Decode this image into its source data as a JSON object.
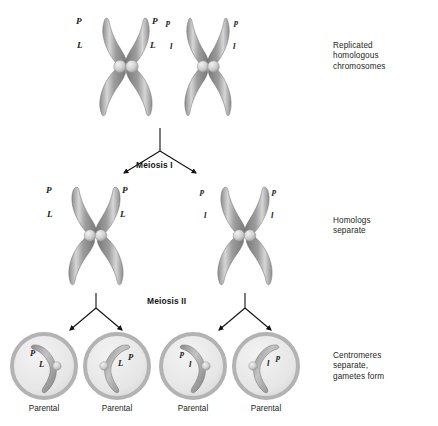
{
  "figure": {
    "stage_labels": {
      "meiosis_i": "Meiosis I",
      "meiosis_ii": "Meiosis II"
    },
    "annotations": [
      {
        "id": "replicated",
        "text": "Replicated\nhomologous\nchromosomes"
      },
      {
        "id": "homologs",
        "text": "Homologs\nseparate"
      },
      {
        "id": "centromeres",
        "text": "Centromeres\nseparate,\ngametes form"
      }
    ],
    "top_chromosomes": [
      {
        "id": "top-left",
        "alleles": [
          {
            "text": "P",
            "pos": "upper-left"
          },
          {
            "text": "P",
            "pos": "upper-right"
          },
          {
            "text": "L",
            "pos": "lower-left"
          },
          {
            "text": "L",
            "pos": "lower-right"
          }
        ]
      },
      {
        "id": "top-right",
        "alleles": [
          {
            "text": "p",
            "pos": "upper-left"
          },
          {
            "text": "p",
            "pos": "upper-right"
          },
          {
            "text": "l",
            "pos": "lower-left"
          },
          {
            "text": "l",
            "pos": "lower-right"
          }
        ]
      }
    ],
    "middle_chromosomes": [
      {
        "id": "mid-left",
        "alleles": [
          {
            "text": "P",
            "pos": "upper-left"
          },
          {
            "text": "P",
            "pos": "upper-right"
          },
          {
            "text": "L",
            "pos": "lower-left"
          },
          {
            "text": "L",
            "pos": "lower-right"
          }
        ]
      },
      {
        "id": "mid-right",
        "alleles": [
          {
            "text": "p",
            "pos": "upper-left"
          },
          {
            "text": "p",
            "pos": "upper-right"
          },
          {
            "text": "l",
            "pos": "lower-left"
          },
          {
            "text": "l",
            "pos": "lower-right"
          }
        ]
      }
    ],
    "gametes": [
      {
        "id": "gamete-1",
        "caption": "Parental",
        "alleles": [
          "P",
          "L"
        ],
        "mirrored": false
      },
      {
        "id": "gamete-2",
        "caption": "Parental",
        "alleles": [
          "L",
          "P"
        ],
        "mirrored": true
      },
      {
        "id": "gamete-3",
        "caption": "Parental",
        "alleles": [
          "p",
          "l"
        ],
        "mirrored": false
      },
      {
        "id": "gamete-4",
        "caption": "Parental",
        "alleles": [
          "l",
          "p"
        ],
        "mirrored": true
      }
    ],
    "colors": {
      "chromosome_dark": "#7d7d7d",
      "chromosome_mid": "#9a9a9a",
      "chromosome_light": "#c9c9c9",
      "centromere": "#cfcfcf",
      "cell_ring": "#b3b3b3",
      "cell_fill": "#e6e6e6",
      "arrow": "#111111",
      "text": "#231f20",
      "background": "#ffffff"
    }
  }
}
